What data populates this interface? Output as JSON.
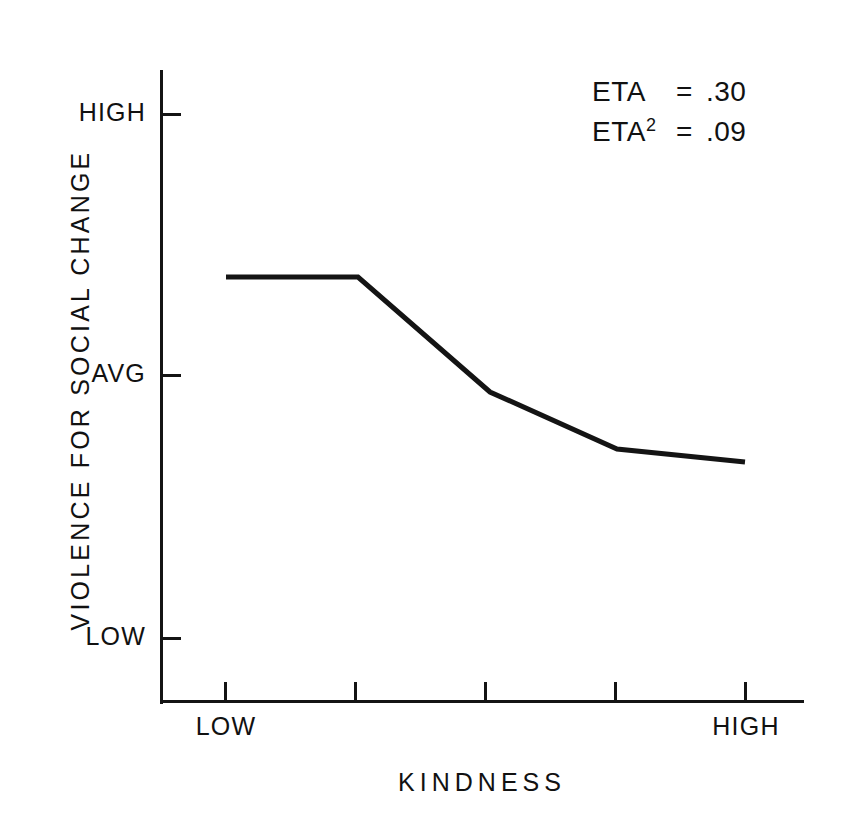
{
  "chart_data": {
    "type": "line",
    "title": "",
    "xlabel": "KINDNESS",
    "ylabel": "VIOLENCE FOR SOCIAL CHANGE",
    "x_tick_labels": [
      "LOW",
      "",
      "",
      "",
      "HIGH"
    ],
    "x_tick_count": 5,
    "y_tick_labels": [
      "HIGH",
      "AVG",
      "LOW"
    ],
    "ylim": [
      0,
      2
    ],
    "y_tick_values": [
      2,
      1,
      0
    ],
    "grid": false,
    "legend": null,
    "categories": [
      "LOW",
      "2",
      "3",
      "4",
      "HIGH"
    ],
    "values": [
      1.62,
      1.62,
      0.93,
      0.71,
      0.66
    ],
    "series": [
      {
        "name": "Violence for social change",
        "values": [
          1.62,
          1.62,
          0.93,
          0.71,
          0.66
        ]
      }
    ],
    "points_px": [
      {
        "x": 226,
        "y": 277
      },
      {
        "x": 358,
        "y": 277
      },
      {
        "x": 490,
        "y": 392
      },
      {
        "x": 617,
        "y": 449
      },
      {
        "x": 745,
        "y": 462
      }
    ],
    "line_color": "#141414",
    "line_width": 5,
    "annotations": [
      {
        "term": "ETA",
        "superscript": "",
        "equals": "=",
        "value": ".30"
      },
      {
        "term": "ETA",
        "superscript": "2",
        "equals": "=",
        "value": ".09"
      }
    ]
  },
  "axes": {
    "y_ticks": [
      {
        "label": "HIGH",
        "y_px": 113
      },
      {
        "label": "AVG",
        "y_px": 374
      },
      {
        "label": "LOW",
        "y_px": 637
      }
    ],
    "x_ticks": [
      {
        "label": "LOW",
        "x_px": 225
      },
      {
        "label": "",
        "x_px": 355
      },
      {
        "label": "",
        "x_px": 485
      },
      {
        "label": "",
        "x_px": 615
      },
      {
        "label": "HIGH",
        "x_px": 745
      }
    ]
  },
  "style": {
    "background": "#ffffff",
    "ink": "#141414"
  }
}
